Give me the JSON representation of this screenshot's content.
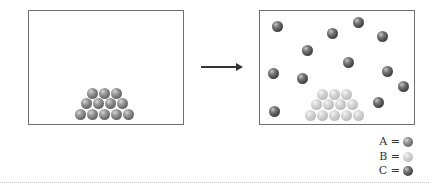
{
  "diagram": {
    "type": "state-change illustration",
    "left_panel": {
      "label": "before",
      "spheres": {
        "species": "A",
        "count": 12,
        "arrangement": "pyramid rows 3/4/5"
      }
    },
    "arrow": {
      "direction": "right"
    },
    "right_panel": {
      "label": "after",
      "spheres": [
        {
          "species": "B",
          "count": 12,
          "arrangement": "pyramid rows 3/4/5"
        },
        {
          "species": "C",
          "count": 12,
          "arrangement": "scattered"
        }
      ]
    },
    "legend": [
      {
        "label": "A =",
        "color": "#7a7a7a"
      },
      {
        "label": "B =",
        "color": "#c8c8c8"
      },
      {
        "label": "C =",
        "color": "#4a4a4a"
      }
    ]
  }
}
